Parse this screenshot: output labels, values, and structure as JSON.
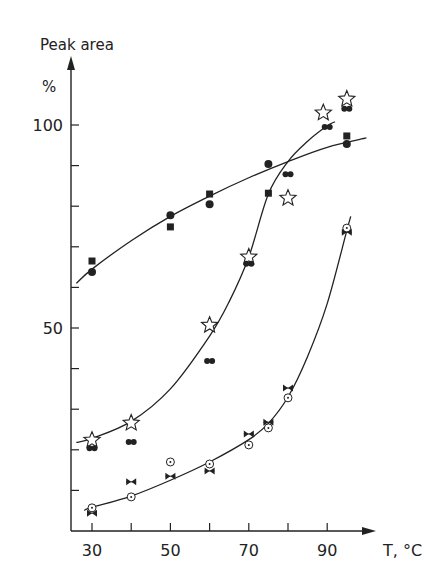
{
  "chart_data": {
    "type": "scatter",
    "title": "",
    "ylabel": "Peak area",
    "yunit": "%",
    "xlabel": "T, °C",
    "xlim": [
      25,
      100
    ],
    "ylim": [
      0,
      110
    ],
    "x_ticks": [
      30,
      40,
      50,
      60,
      70,
      80,
      90
    ],
    "x_tick_labels": [
      "30",
      "50",
      "70",
      "90"
    ],
    "x_tick_label_values": [
      30,
      50,
      70,
      90
    ],
    "y_ticks": [
      10,
      20,
      30,
      40,
      50,
      60,
      70,
      80,
      90,
      100
    ],
    "y_tick_labels": [
      "50",
      "100"
    ],
    "y_tick_label_values": [
      50,
      100
    ],
    "grid": false,
    "legend": null,
    "series": [
      {
        "name": "upper-squares",
        "marker": "filled-square",
        "points": [
          [
            30,
            66.5
          ],
          [
            50,
            74.9
          ],
          [
            60,
            83
          ],
          [
            75,
            83.2
          ],
          [
            95,
            97.3
          ]
        ]
      },
      {
        "name": "upper-circles",
        "marker": "filled-circle",
        "points": [
          [
            30,
            63.8
          ],
          [
            50,
            77.8
          ],
          [
            60,
            80.5
          ],
          [
            75,
            90.4
          ],
          [
            95,
            95.3
          ]
        ]
      },
      {
        "name": "sigmoid-stars",
        "marker": "open-star",
        "points": [
          [
            30,
            22.4
          ],
          [
            40,
            26.6
          ],
          [
            60,
            50.7
          ],
          [
            70,
            67.5
          ],
          [
            80,
            82
          ],
          [
            89,
            103
          ],
          [
            95,
            106.4
          ]
        ]
      },
      {
        "name": "sigmoid-double-dots",
        "marker": "double-dot",
        "points": [
          [
            30,
            20.4
          ],
          [
            40,
            21.9
          ],
          [
            60,
            41.9
          ],
          [
            70,
            65.8
          ],
          [
            80,
            87.9
          ],
          [
            90,
            99.5
          ],
          [
            95,
            104
          ]
        ]
      },
      {
        "name": "lower-open-circles",
        "marker": "dotted-circle",
        "points": [
          [
            30,
            5.7
          ],
          [
            40,
            8.4
          ],
          [
            50,
            17
          ],
          [
            60,
            16.5
          ],
          [
            70,
            21.2
          ],
          [
            75,
            25.4
          ],
          [
            80,
            32.8
          ],
          [
            95,
            74.6
          ]
        ]
      },
      {
        "name": "lower-bowties",
        "marker": "bowtie",
        "points": [
          [
            30,
            4.4
          ],
          [
            40,
            12.1
          ],
          [
            50,
            13.5
          ],
          [
            60,
            14.8
          ],
          [
            70,
            23.9
          ],
          [
            75,
            26.8
          ],
          [
            80,
            35.2
          ],
          [
            95,
            73.6
          ]
        ]
      }
    ],
    "curves": [
      {
        "name": "upper-fit",
        "points": [
          [
            26,
            61
          ],
          [
            30,
            64.5
          ],
          [
            40,
            71.5
          ],
          [
            50,
            77.5
          ],
          [
            60,
            82.5
          ],
          [
            70,
            87
          ],
          [
            80,
            91
          ],
          [
            90,
            94.5
          ],
          [
            100,
            96.8
          ]
        ]
      },
      {
        "name": "sigmoid-fit",
        "points": [
          [
            26,
            21.8
          ],
          [
            30,
            22.8
          ],
          [
            40,
            27
          ],
          [
            50,
            35
          ],
          [
            60,
            48
          ],
          [
            65,
            56.5
          ],
          [
            70,
            67.5
          ],
          [
            75,
            83
          ],
          [
            80,
            91
          ],
          [
            85,
            96
          ],
          [
            90,
            99.8
          ],
          [
            92,
            100.8
          ]
        ]
      },
      {
        "name": "lower-fit",
        "points": [
          [
            28,
            5.1
          ],
          [
            30,
            5.8
          ],
          [
            40,
            8.6
          ],
          [
            50,
            12.5
          ],
          [
            60,
            17
          ],
          [
            70,
            22.5
          ],
          [
            75,
            26.5
          ],
          [
            80,
            33
          ],
          [
            85,
            43
          ],
          [
            90,
            56
          ],
          [
            95,
            74
          ],
          [
            96,
            77.5
          ]
        ]
      }
    ]
  }
}
